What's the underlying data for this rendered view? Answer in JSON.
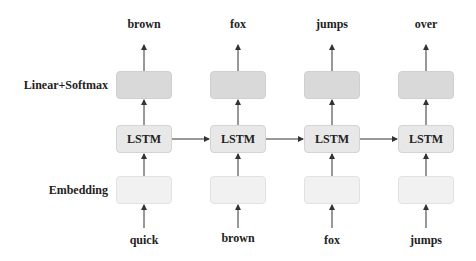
{
  "row_labels": {
    "output_layer": "Linear+Softmax",
    "embedding_layer": "Embedding"
  },
  "cell_label": "LSTM",
  "columns": [
    {
      "input": "quick",
      "output": "brown"
    },
    {
      "input": "brown",
      "output": "fox"
    },
    {
      "input": "fox",
      "output": "jumps"
    },
    {
      "input": "jumps",
      "output": "over"
    }
  ],
  "colors": {
    "softmax_box": "#d9d9d9",
    "lstm_box": "#e8e8e8",
    "embedding_box": "#f1f1f1",
    "arrow": "#333333",
    "text": "#222222"
  }
}
